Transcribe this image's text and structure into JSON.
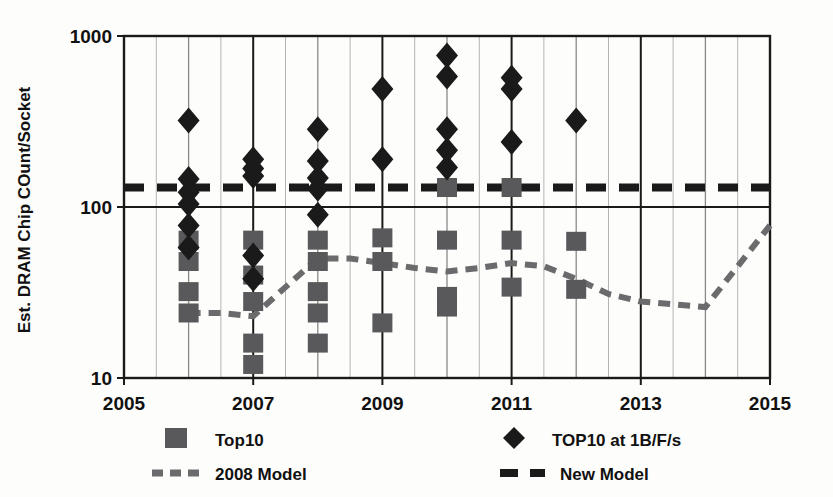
{
  "chart_data": {
    "type": "scatter",
    "title": "",
    "xlabel": "",
    "ylabel": "Est. DRAM Chip COunt/Socket",
    "yscale": "log",
    "ylim": [
      10,
      1000
    ],
    "xlim": [
      2005,
      2015
    ],
    "ytick_labels": [
      "10",
      "100",
      "1000"
    ],
    "ytick_values": [
      10,
      100,
      1000
    ],
    "xtick_labels": [
      "2005",
      "2007",
      "2009",
      "2011",
      "2013",
      "2015"
    ],
    "xtick_values": [
      2005,
      2007,
      2009,
      2011,
      2013,
      2015
    ],
    "minor_gridlines_x": [
      2006,
      2008,
      2010,
      2012,
      2014
    ],
    "grid": "vertical",
    "legend_position": "below",
    "series": [
      {
        "name": "Top10",
        "marker": "square",
        "color": "#59595b",
        "points": [
          {
            "x": 2006,
            "y": 64
          },
          {
            "x": 2006,
            "y": 48
          },
          {
            "x": 2006,
            "y": 32
          },
          {
            "x": 2006,
            "y": 24
          },
          {
            "x": 2007,
            "y": 64
          },
          {
            "x": 2007,
            "y": 40
          },
          {
            "x": 2007,
            "y": 28
          },
          {
            "x": 2007,
            "y": 16
          },
          {
            "x": 2007,
            "y": 12
          },
          {
            "x": 2008,
            "y": 64
          },
          {
            "x": 2008,
            "y": 48
          },
          {
            "x": 2008,
            "y": 32
          },
          {
            "x": 2008,
            "y": 24
          },
          {
            "x": 2008,
            "y": 16
          },
          {
            "x": 2009,
            "y": 66
          },
          {
            "x": 2009,
            "y": 48
          },
          {
            "x": 2009,
            "y": 21
          },
          {
            "x": 2010,
            "y": 130
          },
          {
            "x": 2010,
            "y": 64
          },
          {
            "x": 2010,
            "y": 30
          },
          {
            "x": 2010,
            "y": 26
          },
          {
            "x": 2011,
            "y": 130
          },
          {
            "x": 2011,
            "y": 64
          },
          {
            "x": 2011,
            "y": 34
          },
          {
            "x": 2012,
            "y": 63
          },
          {
            "x": 2012,
            "y": 33
          }
        ]
      },
      {
        "name": "TOP10 at 1B/F/s",
        "marker": "diamond",
        "color": "#1a1a1a",
        "points": [
          {
            "x": 2006,
            "y": 320
          },
          {
            "x": 2006,
            "y": 146
          },
          {
            "x": 2006,
            "y": 122
          },
          {
            "x": 2006,
            "y": 104
          },
          {
            "x": 2006,
            "y": 78
          },
          {
            "x": 2006,
            "y": 58
          },
          {
            "x": 2007,
            "y": 190
          },
          {
            "x": 2007,
            "y": 168
          },
          {
            "x": 2007,
            "y": 152
          },
          {
            "x": 2007,
            "y": 52
          },
          {
            "x": 2007,
            "y": 38
          },
          {
            "x": 2008,
            "y": 285
          },
          {
            "x": 2008,
            "y": 186
          },
          {
            "x": 2008,
            "y": 148
          },
          {
            "x": 2008,
            "y": 128
          },
          {
            "x": 2008,
            "y": 90
          },
          {
            "x": 2009,
            "y": 490
          },
          {
            "x": 2009,
            "y": 190
          },
          {
            "x": 2010,
            "y": 770
          },
          {
            "x": 2010,
            "y": 580
          },
          {
            "x": 2010,
            "y": 285
          },
          {
            "x": 2010,
            "y": 215
          },
          {
            "x": 2010,
            "y": 170
          },
          {
            "x": 2011,
            "y": 570
          },
          {
            "x": 2011,
            "y": 490
          },
          {
            "x": 2011,
            "y": 240
          },
          {
            "x": 2012,
            "y": 320
          }
        ]
      }
    ],
    "lines": [
      {
        "name": "2008 Model",
        "style": "dashed-small",
        "color": "#6b6b6d",
        "points": [
          {
            "x": 2006,
            "y": 24
          },
          {
            "x": 2006.5,
            "y": 24
          },
          {
            "x": 2007,
            "y": 23
          },
          {
            "x": 2007.5,
            "y": 34
          },
          {
            "x": 2008,
            "y": 50
          },
          {
            "x": 2008.5,
            "y": 50
          },
          {
            "x": 2009,
            "y": 47
          },
          {
            "x": 2009.5,
            "y": 44
          },
          {
            "x": 2010,
            "y": 42
          },
          {
            "x": 2010.5,
            "y": 44
          },
          {
            "x": 2011,
            "y": 47
          },
          {
            "x": 2011.5,
            "y": 45
          },
          {
            "x": 2012,
            "y": 38
          },
          {
            "x": 2012.5,
            "y": 31
          },
          {
            "x": 2013,
            "y": 28
          },
          {
            "x": 2013.5,
            "y": 27
          },
          {
            "x": 2014,
            "y": 26
          },
          {
            "x": 2014.5,
            "y": 45
          },
          {
            "x": 2015,
            "y": 78
          }
        ]
      },
      {
        "name": "New Model",
        "style": "dashed-large",
        "color": "#1a1a1a",
        "points": [
          {
            "x": 2005,
            "y": 130
          },
          {
            "x": 2015,
            "y": 130
          }
        ]
      }
    ],
    "legend": [
      {
        "label": "Top10",
        "marker": "square",
        "color": "#59595b"
      },
      {
        "label": "TOP10 at 1B/F/s",
        "marker": "diamond",
        "color": "#1a1a1a"
      },
      {
        "label": "2008 Model",
        "marker": "dashed-small",
        "color": "#6b6b6d"
      },
      {
        "label": "New Model",
        "marker": "dashed-large",
        "color": "#1a1a1a"
      }
    ]
  },
  "axes": {
    "y_title": "Est. DRAM Chip COunt/Socket",
    "y_ticks": [
      "1000",
      "100",
      "10"
    ],
    "x_ticks": [
      "2005",
      "2007",
      "2009",
      "2011",
      "2013",
      "2015"
    ]
  },
  "legend": {
    "top10_label": "Top10",
    "top10_bfs_label": "TOP10 at 1B/F/s",
    "model2008_label": "2008 Model",
    "newmodel_label": "New Model"
  },
  "colors": {
    "square_marker": "#59595b",
    "diamond_marker": "#1a1a1a",
    "model2008_line": "#6b6b6d",
    "newmodel_line": "#1a1a1a",
    "axis": "#1a1a1a",
    "minor_grid": "#8a8a8a",
    "background": "#fdfdfb"
  }
}
